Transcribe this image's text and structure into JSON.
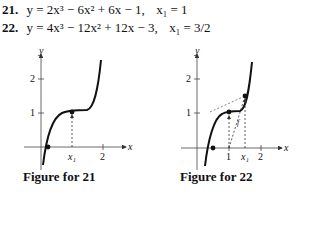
{
  "problems": [
    {
      "number": "21.",
      "equation": "y = 2x³ − 6x² + 6x − 1,",
      "initial": "x₁ = 1"
    },
    {
      "number": "22.",
      "equation": "y = 4x³ − 12x² + 12x − 3,",
      "initial": "x₁ = 3/2"
    }
  ],
  "figures": [
    {
      "caption": "Figure for 21",
      "axis_x": "x",
      "axis_y": "y",
      "y_ticks": [
        "1",
        "2"
      ],
      "x_ticks": [
        "x₁",
        "2"
      ]
    },
    {
      "caption": "Figure for 22",
      "axis_x": "x",
      "axis_y": "y",
      "y_ticks": [
        "1",
        "2"
      ],
      "x_ticks": [
        "1",
        "x₁",
        "2"
      ],
      "curve_label": "f"
    }
  ]
}
